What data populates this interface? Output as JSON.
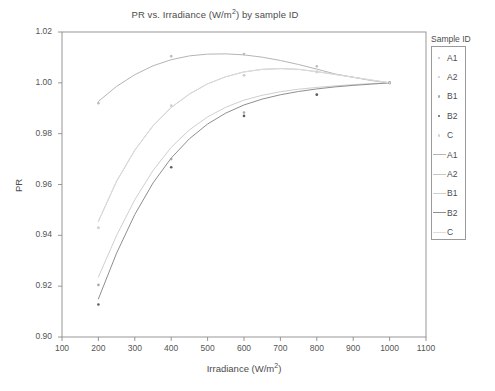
{
  "figure": {
    "width": 495,
    "height": 391,
    "background": "#ffffff"
  },
  "title": "PR vs. Irradiance (W/m",
  "title_sup": "2",
  "title_tail": ") by sample ID",
  "title_full": "PR vs. Irradiance (W/m2) by sample ID",
  "axes": {
    "xlabel_head": "Irradiance (W/m",
    "xlabel_sup": "2",
    "xlabel_tail": ")",
    "xlabel_full": "Irradiance (W/m2)",
    "ylabel": "PR"
  },
  "legend": {
    "title": "Sample ID",
    "point_entries": [
      {
        "label": "A1",
        "color": "#bdbdbd"
      },
      {
        "label": "A2",
        "color": "#c9c9c9"
      },
      {
        "label": "B1",
        "color": "#a8a8a8"
      },
      {
        "label": "B2",
        "color": "#5e5e5e"
      },
      {
        "label": "C",
        "color": "#d2d2d2"
      }
    ],
    "line_entries": [
      {
        "label": "A1",
        "color": "#b5b5b5"
      },
      {
        "label": "A2",
        "color": "#c6c6c6"
      },
      {
        "label": "B1",
        "color": "#cfcfcf"
      },
      {
        "label": "B2",
        "color": "#8f8f8f"
      },
      {
        "label": "C",
        "color": "#dcdcdc"
      }
    ]
  },
  "chart_data": {
    "type": "scatter",
    "title": "PR vs. Irradiance (W/m2) by sample ID",
    "xlabel": "Irradiance (W/m2)",
    "ylabel": "PR",
    "xlim": [
      100,
      1100
    ],
    "ylim": [
      0.9,
      1.02
    ],
    "xticks": [
      100,
      200,
      300,
      400,
      500,
      600,
      700,
      800,
      900,
      1000,
      1100
    ],
    "xtick_labels": [
      "100",
      "200",
      "300",
      "400",
      "500",
      "600",
      "700",
      "800",
      "900",
      "1000",
      "1100"
    ],
    "yticks": [
      0.9,
      0.92,
      0.94,
      0.96,
      0.98,
      1.0,
      1.02
    ],
    "ytick_labels": [
      "0.90",
      "0.92",
      "0.94",
      "0.96",
      "0.98",
      "1.00",
      "1.02"
    ],
    "grid": false,
    "legend_position": "right-outside",
    "x": [
      200,
      400,
      600,
      800,
      1000
    ],
    "series": [
      {
        "name": "A1",
        "marker_color": "#bdbdbd",
        "line_color": "#b5b5b5",
        "values": [
          0.992,
          1.0105,
          1.0113,
          1.0065,
          1.0
        ],
        "fit": [
          [
            200,
            0.9927
          ],
          [
            250,
            0.9986
          ],
          [
            300,
            1.0032
          ],
          [
            350,
            1.0067
          ],
          [
            400,
            1.0091
          ],
          [
            450,
            1.0106
          ],
          [
            500,
            1.0113
          ],
          [
            550,
            1.0114
          ],
          [
            600,
            1.011
          ],
          [
            650,
            1.0101
          ],
          [
            700,
            1.0088
          ],
          [
            750,
            1.0072
          ],
          [
            800,
            1.0054
          ],
          [
            850,
            1.0035
          ],
          [
            900,
            1.0022
          ],
          [
            950,
            1.0009
          ],
          [
            1000,
            1.0
          ]
        ]
      },
      {
        "name": "A2",
        "marker_color": "#c9c9c9",
        "line_color": "#c6c6c6",
        "values": [
          0.943,
          0.991,
          1.003,
          1.0043,
          1.0
        ],
        "fit": [
          [
            200,
            0.9455
          ],
          [
            250,
            0.9613
          ],
          [
            300,
            0.9735
          ],
          [
            350,
            0.9831
          ],
          [
            400,
            0.9903
          ],
          [
            450,
            0.9956
          ],
          [
            500,
            0.9996
          ],
          [
            550,
            1.0024
          ],
          [
            600,
            1.0043
          ],
          [
            650,
            1.0053
          ],
          [
            700,
            1.0056
          ],
          [
            750,
            1.0053
          ],
          [
            800,
            1.0044
          ],
          [
            850,
            1.0033
          ],
          [
            900,
            1.0022
          ],
          [
            950,
            1.0011
          ],
          [
            1000,
            1.0
          ]
        ]
      },
      {
        "name": "B1",
        "marker_color": "#a8a8a8",
        "line_color": "#cfcfcf",
        "values": [
          0.9205,
          0.97,
          0.9883,
          0.9955,
          1.0
        ],
        "fit": [
          [
            200,
            0.9236
          ],
          [
            250,
            0.94
          ],
          [
            300,
            0.954
          ],
          [
            350,
            0.9655
          ],
          [
            400,
            0.9746
          ],
          [
            450,
            0.9815
          ],
          [
            500,
            0.9866
          ],
          [
            550,
            0.9904
          ],
          [
            600,
            0.9932
          ],
          [
            650,
            0.9951
          ],
          [
            700,
            0.9965
          ],
          [
            750,
            0.9975
          ],
          [
            800,
            0.9982
          ],
          [
            850,
            0.9988
          ],
          [
            900,
            0.9993
          ],
          [
            950,
            0.9997
          ],
          [
            1000,
            1.0
          ]
        ]
      },
      {
        "name": "B2",
        "marker_color": "#5e5e5e",
        "line_color": "#8f8f8f",
        "values": [
          0.9128,
          0.9668,
          0.987,
          0.9953,
          1.0
        ],
        "fit": [
          [
            200,
            0.915
          ],
          [
            250,
            0.933
          ],
          [
            300,
            0.9482
          ],
          [
            350,
            0.9606
          ],
          [
            400,
            0.9704
          ],
          [
            450,
            0.978
          ],
          [
            500,
            0.9838
          ],
          [
            550,
            0.9881
          ],
          [
            600,
            0.9913
          ],
          [
            650,
            0.9936
          ],
          [
            700,
            0.9953
          ],
          [
            750,
            0.9966
          ],
          [
            800,
            0.9976
          ],
          [
            850,
            0.9984
          ],
          [
            900,
            0.999
          ],
          [
            950,
            0.9995
          ],
          [
            1000,
            1.0
          ]
        ]
      },
      {
        "name": "C",
        "marker_color": "#d2d2d2",
        "line_color": "#dcdcdc",
        "values": [
          0.943,
          0.991,
          1.003,
          1.0043,
          1.0
        ],
        "fit": [
          [
            200,
            0.9455
          ],
          [
            250,
            0.9613
          ],
          [
            300,
            0.9735
          ],
          [
            350,
            0.9831
          ],
          [
            400,
            0.9903
          ],
          [
            450,
            0.9956
          ],
          [
            500,
            0.9996
          ],
          [
            550,
            1.0024
          ],
          [
            600,
            1.0043
          ],
          [
            650,
            1.0053
          ],
          [
            700,
            1.0056
          ],
          [
            750,
            1.0053
          ],
          [
            800,
            1.0044
          ],
          [
            850,
            1.0033
          ],
          [
            900,
            1.0022
          ],
          [
            950,
            1.0011
          ],
          [
            1000,
            1.0
          ]
        ]
      }
    ]
  },
  "style": {
    "frame_color": "#8c8c8c",
    "tick_color": "#8c8c8c",
    "text_color": "#4c4c4c"
  }
}
